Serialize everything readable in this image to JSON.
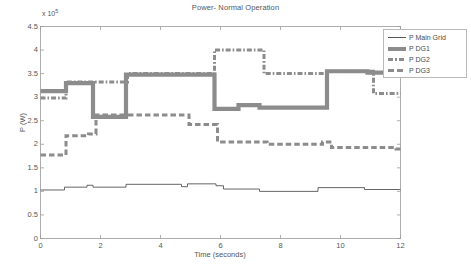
{
  "chart_data": {
    "type": "line",
    "title": "Power- Normal Operation",
    "xlabel": "Time (seconds)",
    "ylabel": "P (W)",
    "exponent_prefix": "x 10",
    "exponent_power": "5",
    "xlim": [
      0,
      12
    ],
    "ylim": [
      0,
      4.5
    ],
    "xticks": [
      "0",
      "2",
      "4",
      "6",
      "8",
      "10",
      "12"
    ],
    "xtick_values": [
      0,
      2,
      4,
      6,
      8,
      10,
      12
    ],
    "yticks": [
      "0",
      "0.5",
      "1",
      "1.5",
      "2",
      "2.5",
      "3",
      "3.5",
      "4",
      "4.5"
    ],
    "ytick_values": [
      0,
      0.5,
      1,
      1.5,
      2,
      2.5,
      3,
      3.5,
      4,
      4.5
    ],
    "grid": false,
    "legend_position": "top-right",
    "series": [
      {
        "name": "P Main Grid",
        "style": "solid-thin",
        "color": "#555555",
        "points": [
          [
            0.0,
            1.03
          ],
          [
            0.8,
            1.03
          ],
          [
            0.8,
            1.09
          ],
          [
            1.55,
            1.09
          ],
          [
            1.55,
            1.13
          ],
          [
            1.75,
            1.13
          ],
          [
            1.75,
            1.09
          ],
          [
            2.85,
            1.09
          ],
          [
            2.85,
            1.15
          ],
          [
            4.7,
            1.15
          ],
          [
            4.7,
            1.1
          ],
          [
            4.9,
            1.1
          ],
          [
            4.9,
            1.16
          ],
          [
            5.85,
            1.16
          ],
          [
            5.85,
            1.12
          ],
          [
            6.1,
            1.12
          ],
          [
            6.1,
            1.05
          ],
          [
            7.3,
            1.05
          ],
          [
            7.3,
            1.0
          ],
          [
            9.25,
            1.0
          ],
          [
            9.25,
            1.08
          ],
          [
            10.8,
            1.08
          ],
          [
            10.8,
            1.04
          ],
          [
            12.0,
            1.04
          ]
        ]
      },
      {
        "name": "P DG1",
        "style": "solid-thick",
        "color": "#8c8c8c",
        "points": [
          [
            0.0,
            3.13
          ],
          [
            0.85,
            3.13
          ],
          [
            0.85,
            3.3
          ],
          [
            1.75,
            3.3
          ],
          [
            1.75,
            2.58
          ],
          [
            2.85,
            2.58
          ],
          [
            2.85,
            3.48
          ],
          [
            5.8,
            3.48
          ],
          [
            5.8,
            2.75
          ],
          [
            6.6,
            2.75
          ],
          [
            6.6,
            2.83
          ],
          [
            7.3,
            2.83
          ],
          [
            7.3,
            2.78
          ],
          [
            9.55,
            2.78
          ],
          [
            9.55,
            3.55
          ],
          [
            10.9,
            3.55
          ],
          [
            10.9,
            3.52
          ],
          [
            12.0,
            3.52
          ]
        ]
      },
      {
        "name": "P DG2",
        "style": "dash-dot",
        "color": "#8c8c8c",
        "points": [
          [
            0.0,
            2.98
          ],
          [
            0.85,
            2.98
          ],
          [
            0.85,
            3.32
          ],
          [
            2.9,
            3.32
          ],
          [
            2.9,
            3.5
          ],
          [
            5.8,
            3.5
          ],
          [
            5.8,
            4.0
          ],
          [
            7.45,
            4.0
          ],
          [
            7.45,
            3.5
          ],
          [
            9.6,
            3.5
          ],
          [
            9.6,
            3.55
          ],
          [
            11.1,
            3.55
          ],
          [
            11.1,
            3.08
          ],
          [
            12.0,
            3.08
          ]
        ]
      },
      {
        "name": "P DG3",
        "style": "dashed",
        "color": "#8c8c8c",
        "points": [
          [
            0.0,
            1.77
          ],
          [
            0.85,
            1.77
          ],
          [
            0.85,
            2.18
          ],
          [
            1.6,
            2.18
          ],
          [
            1.6,
            2.22
          ],
          [
            1.85,
            2.22
          ],
          [
            1.85,
            2.62
          ],
          [
            4.95,
            2.62
          ],
          [
            4.95,
            2.42
          ],
          [
            5.9,
            2.42
          ],
          [
            5.9,
            2.05
          ],
          [
            7.55,
            2.05
          ],
          [
            7.55,
            2.0
          ],
          [
            9.4,
            2.0
          ],
          [
            9.4,
            2.05
          ],
          [
            9.7,
            2.05
          ],
          [
            9.7,
            1.93
          ],
          [
            11.85,
            1.93
          ],
          [
            11.85,
            1.9
          ],
          [
            12.0,
            1.9
          ]
        ]
      }
    ]
  },
  "legend": {
    "items": [
      {
        "label": "P Main Grid",
        "key": "thin"
      },
      {
        "label": "P DG1",
        "key": "thick"
      },
      {
        "label": "P DG2",
        "key": "dashdot"
      },
      {
        "label": "P DG3",
        "key": "dash"
      }
    ]
  }
}
